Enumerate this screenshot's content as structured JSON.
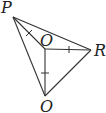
{
  "diagram": {
    "type": "geometry",
    "points": [
      {
        "id": "P",
        "label": "P",
        "x": 13,
        "y": 17
      },
      {
        "id": "O",
        "label": "O",
        "x": 45,
        "y": 49
      },
      {
        "id": "R",
        "label": "R",
        "x": 91,
        "y": 50
      },
      {
        "id": "B",
        "label": "O",
        "x": 45,
        "y": 96
      }
    ],
    "segments": [
      [
        "P",
        "R"
      ],
      [
        "R",
        "B"
      ],
      [
        "B",
        "P"
      ],
      [
        "P",
        "O"
      ],
      [
        "O",
        "R"
      ],
      [
        "O",
        "B"
      ]
    ],
    "equal_tick_segments": [
      [
        "P",
        "O"
      ],
      [
        "O",
        "R"
      ],
      [
        "O",
        "B"
      ]
    ],
    "labels": {
      "p": "P",
      "o": "O",
      "r": "R",
      "bottom": "O"
    },
    "colors": {
      "stroke": "#333333",
      "text": "#222222",
      "background": "#ffffff"
    }
  }
}
